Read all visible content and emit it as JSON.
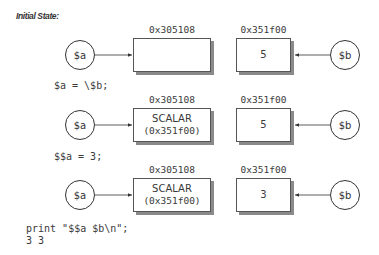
{
  "title": "Initial State:",
  "rows": [
    {
      "var_a": "$a",
      "var_b": "$b",
      "box1": {
        "address": "0x305108",
        "line1": "",
        "line2": ""
      },
      "box2": {
        "address": "0x351f00",
        "value": "5"
      }
    },
    {
      "code": "$a = \\$b;",
      "var_a": "$a",
      "var_b": "$b",
      "box1": {
        "address": "0x305108",
        "line1": "SCALAR",
        "line2": "(0x351f00)"
      },
      "box2": {
        "address": "0x351f00",
        "value": "5"
      }
    },
    {
      "code": "$$a = 3;",
      "var_a": "$a",
      "var_b": "$b",
      "box1": {
        "address": "0x305108",
        "line1": "SCALAR",
        "line2": "(0x351f00)"
      },
      "box2": {
        "address": "0x351f00",
        "value": "3"
      }
    }
  ],
  "print_statement": "print \"$$a $b\\n\";",
  "output": "3 3",
  "colors": {
    "stroke": "#333333",
    "shadow": "#8a8a8a",
    "text": "#3a3a3a"
  }
}
